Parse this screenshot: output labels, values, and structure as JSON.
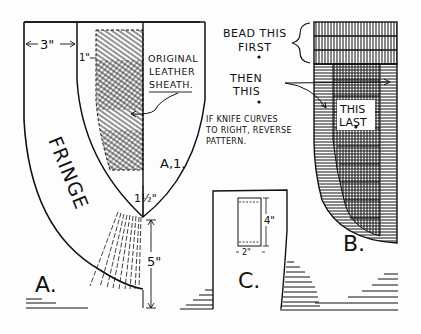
{
  "figure_a": {
    "label": "A.",
    "sublabel": "A,1.",
    "fringe": "FRINGE",
    "dim_width": "3\"",
    "dim_offset": "1\"",
    "dim_tip": "1½\"",
    "dim_length": "5\"",
    "callout_line1": "ORIGINAL",
    "callout_line2": "LEATHER",
    "callout_line3": "SHEATH."
  },
  "figure_b": {
    "label": "B.",
    "step1_line1": "BEAD THIS",
    "step1_line2": "FIRST",
    "step2_line1": "THEN",
    "step2_line2": "THIS",
    "step3_line1": "THIS",
    "step3_line2": "LAST",
    "note_line1": "IF KNIFE CURVES",
    "note_line2": "TO RIGHT, REVERSE",
    "note_line3": "PATTERN."
  },
  "figure_c": {
    "label": "C.",
    "dim_height": "4\"",
    "dim_width": "2\""
  },
  "colors": {
    "ink": "#111111",
    "paper": "#fdfdfd"
  }
}
